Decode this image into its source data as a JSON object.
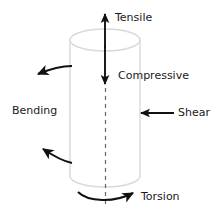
{
  "diagram": {
    "shape": {
      "name": "cylinder",
      "outline_color": "#d8d8d8",
      "fill_color": "#ffffff"
    },
    "arrow_color": "#111111",
    "centerline": {
      "style": "dashed",
      "color": "#555555"
    },
    "labels": {
      "tensile": "Tensile",
      "compressive": "Compressive",
      "bending": "Bending",
      "shear": "Shear",
      "torsion": "Torsion"
    },
    "load_modes": [
      {
        "id": "tensile",
        "label": "Tensile",
        "arrow": "straight-up",
        "label_x": 115,
        "label_y": 18
      },
      {
        "id": "compressive",
        "label": "Compressive",
        "arrow": "straight-down",
        "label_x": 118,
        "label_y": 76
      },
      {
        "id": "bending",
        "label": "Bending",
        "arrow": "curved-left-pair",
        "label_x": 12,
        "label_y": 111
      },
      {
        "id": "shear",
        "label": "Shear",
        "arrow": "straight-left",
        "label_x": 178,
        "label_y": 113
      },
      {
        "id": "torsion",
        "label": "Torsion",
        "arrow": "curved-right",
        "label_x": 141,
        "label_y": 197
      }
    ]
  }
}
